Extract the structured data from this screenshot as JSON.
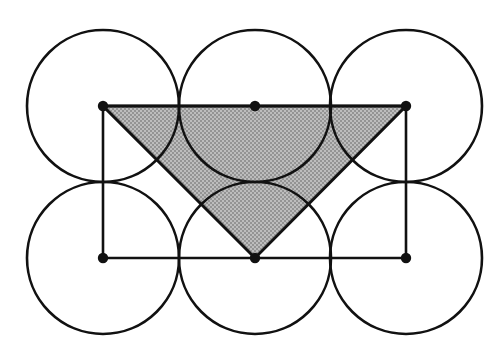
{
  "figure": {
    "canvas": {
      "width": 497,
      "height": 358,
      "background": "#ffffff"
    },
    "style": {
      "stroke_color": "#111111",
      "circle_stroke_width": 2.6,
      "rect_stroke_width": 2.6,
      "triangle_stroke_width": 3.0,
      "shade_fill": "#a9a9a9",
      "dot_fill": "#111111",
      "dot_radius": 5.2
    },
    "grid": {
      "columns": 3,
      "rows": 2,
      "radius": 76,
      "center_x": [
        103,
        255,
        406
      ],
      "center_y": [
        106,
        258
      ]
    },
    "circles": [
      {
        "name": "circle-top-left",
        "cx": 103,
        "cy": 106,
        "r": 76
      },
      {
        "name": "circle-top-middle",
        "cx": 255,
        "cy": 106,
        "r": 76
      },
      {
        "name": "circle-top-right",
        "cx": 406,
        "cy": 106,
        "r": 76
      },
      {
        "name": "circle-bottom-left",
        "cx": 103,
        "cy": 258,
        "r": 76
      },
      {
        "name": "circle-bottom-middle",
        "cx": 255,
        "cy": 258,
        "r": 76
      },
      {
        "name": "circle-bottom-right",
        "cx": 406,
        "cy": 258,
        "r": 76
      }
    ],
    "rectangle": {
      "name": "center-rectangle",
      "points": "103,106 406,106 406,258 103,258",
      "x": 103,
      "y": 106,
      "width": 303,
      "height": 152
    },
    "bottom_edge": {
      "name": "bottom-edge-line",
      "x1": 103,
      "y1": 258,
      "x2": 406,
      "y2": 258
    },
    "triangle": {
      "name": "shaded-triangle",
      "points": "103,106 406,106 255,258",
      "vertices": [
        {
          "label": "top-left",
          "x": 103,
          "y": 106
        },
        {
          "label": "top-right",
          "x": 406,
          "y": 106
        },
        {
          "label": "bottom-middle",
          "x": 255,
          "y": 258
        }
      ],
      "fill": "#a9a9a9"
    },
    "dots": [
      {
        "name": "dot-top-left",
        "cx": 103,
        "cy": 106,
        "r": 5.2
      },
      {
        "name": "dot-top-middle",
        "cx": 255,
        "cy": 106,
        "r": 5.2
      },
      {
        "name": "dot-top-right",
        "cx": 406,
        "cy": 106,
        "r": 5.2
      },
      {
        "name": "dot-bottom-left",
        "cx": 103,
        "cy": 258,
        "r": 5.2
      },
      {
        "name": "dot-bottom-middle",
        "cx": 255,
        "cy": 258,
        "r": 5.2
      },
      {
        "name": "dot-bottom-right",
        "cx": 406,
        "cy": 258,
        "r": 5.2
      }
    ]
  }
}
